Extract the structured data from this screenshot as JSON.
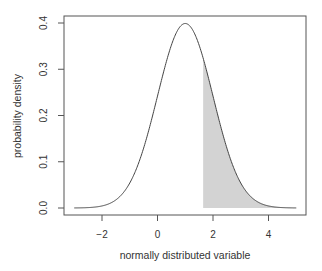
{
  "chart_data": {
    "type": "area",
    "title": "",
    "xlabel": "normally distributed variable",
    "ylabel": "probability density",
    "xlim": [
      -3,
      5
    ],
    "ylim": [
      0,
      0.4
    ],
    "x_ticks": [
      "-2",
      "0",
      "2",
      "4"
    ],
    "x_tick_values": [
      -2,
      0,
      2,
      4
    ],
    "y_ticks": [
      "0.0",
      "0.1",
      "0.2",
      "0.3",
      "0.4"
    ],
    "y_tick_values": [
      0,
      0.1,
      0.2,
      0.3,
      0.4
    ],
    "grid": false,
    "legend": null,
    "series": [
      {
        "name": "normal density",
        "distribution": "normal",
        "mean": 1,
        "sd": 1,
        "x_range": [
          -3,
          5
        ],
        "line_color": "#444444"
      }
    ],
    "shaded_region": {
      "from": 1.645,
      "to": 5,
      "fill_color": "#d3d3d3"
    }
  }
}
